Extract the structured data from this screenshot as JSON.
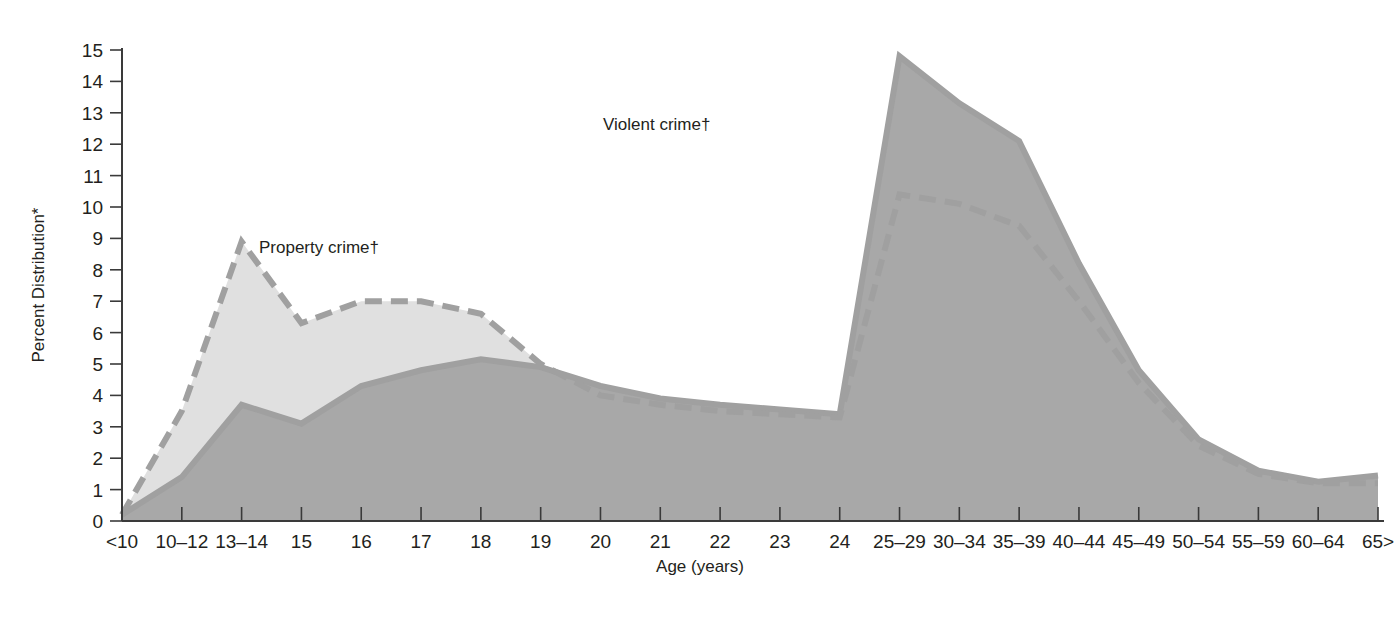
{
  "chart_data": {
    "type": "area",
    "title": "",
    "xlabel": "Age (years)",
    "ylabel": "Percent Distribution*",
    "ylim": [
      0,
      15
    ],
    "ytick_step": 1,
    "grid": false,
    "legend_position": "inline-annotation",
    "categories": [
      "<10",
      "10–12",
      "13–14",
      "15",
      "16",
      "17",
      "18",
      "19",
      "20",
      "21",
      "22",
      "23",
      "24",
      "25–29",
      "30–34",
      "35–39",
      "40–44",
      "45–49",
      "50–54",
      "55–59",
      "60–64",
      "65>"
    ],
    "yticks": [
      "0",
      "1",
      "2",
      "3",
      "4",
      "5",
      "6",
      "7",
      "8",
      "9",
      "10",
      "11",
      "12",
      "13",
      "14",
      "15"
    ],
    "series": [
      {
        "name": "Property crime†",
        "style": "dashed",
        "fill_color": "#e0e0e0",
        "line_color": "#a0a0a0",
        "values": [
          0.2,
          3.5,
          8.9,
          6.3,
          7.0,
          7.0,
          6.6,
          5.0,
          4.0,
          3.7,
          3.5,
          3.4,
          3.3,
          10.4,
          10.1,
          9.4,
          7.0,
          4.4,
          2.4,
          1.5,
          1.2,
          1.2
        ]
      },
      {
        "name": "Violent crime†",
        "style": "solid",
        "fill_color": "#a8a8a8",
        "line_color": "#a0a0a0",
        "values": [
          0.2,
          1.4,
          3.7,
          3.1,
          4.3,
          4.8,
          5.15,
          4.9,
          4.3,
          3.9,
          3.7,
          3.55,
          3.4,
          14.8,
          13.3,
          12.1,
          8.2,
          4.8,
          2.6,
          1.6,
          1.25,
          1.45
        ]
      }
    ],
    "annotations": [
      {
        "text": "Property crime†",
        "x_px": 259,
        "y_px": 253
      },
      {
        "text": "Violent crime†",
        "x_px": 603,
        "y_px": 130
      }
    ]
  }
}
